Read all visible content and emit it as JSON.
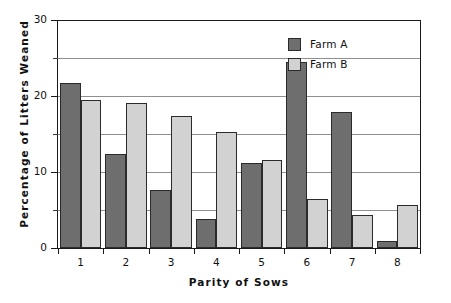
{
  "chart_data": {
    "type": "bar",
    "title": "",
    "xlabel": "Parity  of  Sows",
    "ylabel": "Percentage  of  Litters  Weaned",
    "categories": [
      "1",
      "2",
      "3",
      "4",
      "5",
      "6",
      "7",
      "8"
    ],
    "series": [
      {
        "name": "Farm A",
        "color": "#6e6e6e",
        "values": [
          21.7,
          12.4,
          7.6,
          3.8,
          11.2,
          24.5,
          17.9,
          0.9
        ]
      },
      {
        "name": "Farm B",
        "color": "#d2d2d2",
        "values": [
          19.5,
          19.1,
          17.4,
          15.2,
          11.6,
          6.5,
          4.4,
          5.6
        ]
      }
    ],
    "ylim": [
      0,
      30
    ],
    "ytick_labels": [
      "0",
      "10",
      "20",
      "30"
    ],
    "ytick_values": [
      0,
      10,
      20,
      30
    ],
    "yminor_tick_values": [
      5,
      15,
      25
    ],
    "gridline_values": [
      5,
      10,
      15,
      20,
      25
    ],
    "grid": true,
    "legend_position": "top-right",
    "legend_entries": [
      "Farm A",
      "Farm B"
    ]
  },
  "axes": {
    "y_title": "Percentage  of  Litters  Weaned",
    "x_title": "Parity  of  Sows"
  },
  "legend": {
    "entries": [
      {
        "label": "Farm A",
        "color": "#6e6e6e"
      },
      {
        "label": "Farm B",
        "color": "#d2d2d2"
      }
    ]
  }
}
